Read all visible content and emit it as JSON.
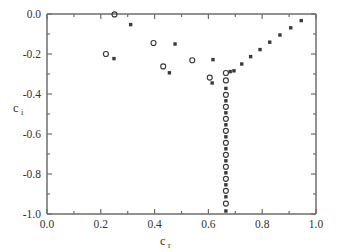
{
  "figure": {
    "background_color": "#ffffff",
    "marker_color": "#3a3a38",
    "axis_color": "#6d6d68"
  },
  "chart_data": {
    "type": "scatter",
    "title": "",
    "xlabel": "c",
    "xlabel_sub": "r",
    "ylabel": "c",
    "ylabel_sub": "i",
    "xlim": [
      0.0,
      1.0
    ],
    "ylim": [
      -1.0,
      0.0
    ],
    "xticks": [
      0.0,
      0.2,
      0.4,
      0.6,
      0.8,
      1.0
    ],
    "yticks": [
      0.0,
      -0.2,
      -0.4,
      -0.6,
      -0.8,
      -1.0
    ],
    "xticklabels": [
      "0.0",
      "0.2",
      "0.4",
      "0.6",
      "0.8",
      "1.0"
    ],
    "yticklabels": [
      "0.0",
      "-0.2",
      "-0.4",
      "-0.6",
      "-0.8",
      "-1.0"
    ],
    "grid": false,
    "legend": null,
    "minor_ticks": true,
    "series": [
      {
        "name": "left-branch-open",
        "marker": "open-circle",
        "points": [
          [
            0.251,
            -0.002
          ],
          [
            0.219,
            -0.2
          ],
          [
            0.396,
            -0.145
          ],
          [
            0.432,
            -0.262
          ],
          [
            0.54,
            -0.231
          ],
          [
            0.605,
            -0.318
          ],
          [
            0.665,
            -0.295
          ]
        ]
      },
      {
        "name": "left-branch-filled",
        "marker": "filled-square",
        "points": [
          [
            0.311,
            -0.053
          ],
          [
            0.249,
            -0.223
          ],
          [
            0.455,
            -0.294
          ],
          [
            0.476,
            -0.15
          ],
          [
            0.617,
            -0.228
          ],
          [
            0.614,
            -0.345
          ],
          [
            0.681,
            -0.288
          ]
        ]
      },
      {
        "name": "vertical-branch",
        "marker": "alternating",
        "cr": 0.665,
        "points": [
          [
            0.665,
            -0.332
          ],
          [
            0.665,
            -0.372
          ],
          [
            0.665,
            -0.404
          ],
          [
            0.665,
            -0.434
          ],
          [
            0.665,
            -0.464
          ],
          [
            0.665,
            -0.494
          ],
          [
            0.665,
            -0.524
          ],
          [
            0.665,
            -0.554
          ],
          [
            0.665,
            -0.584
          ],
          [
            0.665,
            -0.614
          ],
          [
            0.665,
            -0.644
          ],
          [
            0.665,
            -0.674
          ],
          [
            0.665,
            -0.704
          ],
          [
            0.665,
            -0.734
          ],
          [
            0.665,
            -0.764
          ],
          [
            0.665,
            -0.794
          ],
          [
            0.665,
            -0.824
          ],
          [
            0.665,
            -0.854
          ],
          [
            0.665,
            -0.884
          ],
          [
            0.665,
            -0.914
          ],
          [
            0.665,
            -0.948
          ],
          [
            0.665,
            -0.985
          ]
        ]
      },
      {
        "name": "right-branch",
        "marker": "filled-square",
        "points": [
          [
            0.695,
            -0.284
          ],
          [
            0.724,
            -0.25
          ],
          [
            0.757,
            -0.213
          ],
          [
            0.792,
            -0.178
          ],
          [
            0.828,
            -0.141
          ],
          [
            0.866,
            -0.105
          ],
          [
            0.906,
            -0.069
          ],
          [
            0.945,
            -0.033
          ]
        ]
      }
    ]
  }
}
